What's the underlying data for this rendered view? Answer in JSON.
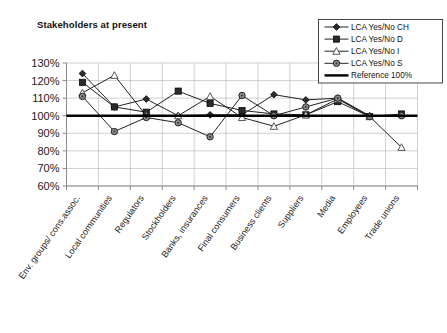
{
  "chart_data": {
    "type": "line",
    "title": "Stakeholders at present",
    "xlabel": "",
    "ylabel": "",
    "ylim": [
      60,
      130
    ],
    "ytick_labels": [
      "130%",
      "120%",
      "110%",
      "100%",
      "90%",
      "80%",
      "70%",
      "60%"
    ],
    "ytick_values": [
      130,
      120,
      110,
      100,
      90,
      80,
      70,
      60
    ],
    "grid": true,
    "legend_position": "top-right",
    "categories": [
      "Env. groups/ cons.assoc.",
      "Local communities",
      "Regulators",
      "Stockholders",
      "Banks, insurances",
      "Final consumers",
      "Business clients",
      "Suppliers",
      "Media",
      "Employees",
      "Trade unions"
    ],
    "series": [
      {
        "name": "LCA Yes/No CH",
        "marker": "diamond",
        "values": [
          124,
          105,
          109.5,
          100,
          100.5,
          100.5,
          112,
          109,
          110,
          100,
          100
        ]
      },
      {
        "name": "LCA Yes/No D",
        "marker": "square",
        "values": [
          119,
          105,
          102,
          114,
          107,
          103,
          101,
          100.5,
          108,
          99.5,
          101
        ]
      },
      {
        "name": "LCA Yes/No I",
        "marker": "triangle",
        "values": [
          113,
          123,
          100,
          100,
          111,
          99,
          94,
          100.5,
          109.5,
          99.5,
          82
        ]
      },
      {
        "name": "LCA Yes/No S",
        "marker": "circle",
        "values": [
          111,
          91,
          99,
          96,
          88,
          111.5,
          100,
          105,
          110,
          99.5,
          100
        ]
      }
    ],
    "reference": {
      "name": "Reference 100%",
      "marker": "line",
      "value": 100
    }
  },
  "legend": {
    "items": [
      {
        "label": "LCA Yes/No CH",
        "marker": "diamond"
      },
      {
        "label": "LCA Yes/No D",
        "marker": "square"
      },
      {
        "label": "LCA Yes/No I",
        "marker": "triangle"
      },
      {
        "label": "LCA Yes/No S",
        "marker": "circle"
      },
      {
        "label": "Reference 100%",
        "marker": "line"
      }
    ]
  },
  "colors": {
    "marker_fill_dark": "#2b2b2b",
    "marker_fill_light": "#8c8c8c",
    "marker_fill_white": "#ffffff",
    "line": "#222222",
    "reference_line": "#000000",
    "grid": "#bbbbbb",
    "text": "#111111"
  }
}
